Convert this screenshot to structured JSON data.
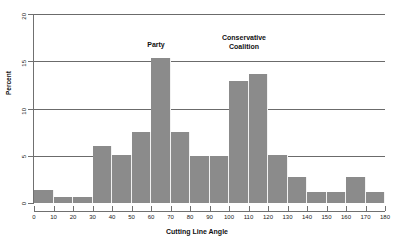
{
  "chart_data": {
    "type": "bar",
    "title": "",
    "subtitle": "",
    "xlabel": "Cutting Line Angle",
    "ylabel": "Percent",
    "xlim": [
      0,
      180
    ],
    "ylim": [
      0,
      20
    ],
    "grid": true,
    "legend_position": "none",
    "bar_color": "#8b8b8b",
    "gridline_color": "#6b6b6b",
    "axis_color": "#707070",
    "xtick_labels": [
      "0",
      "10",
      "20",
      "30",
      "40",
      "50",
      "60",
      "70",
      "80",
      "90",
      "100",
      "110",
      "120",
      "130",
      "140",
      "150",
      "160",
      "170",
      "180"
    ],
    "xtick_values": [
      0,
      10,
      20,
      30,
      40,
      50,
      60,
      70,
      80,
      90,
      100,
      110,
      120,
      130,
      140,
      150,
      160,
      170,
      180
    ],
    "ytick_labels": [
      "0",
      "5",
      "10",
      "15",
      "20"
    ],
    "ytick_values": [
      0,
      5,
      10,
      15,
      20
    ],
    "bin_width": 10,
    "categories": [
      "0-10",
      "10-20",
      "20-30",
      "30-40",
      "40-50",
      "50-60",
      "60-70",
      "70-80",
      "80-90",
      "90-100",
      "100-110",
      "110-120",
      "120-130",
      "130-140",
      "140-150",
      "150-160",
      "160-170",
      "170-180"
    ],
    "bin_starts": [
      0,
      10,
      20,
      30,
      40,
      50,
      60,
      70,
      80,
      90,
      100,
      110,
      120,
      130,
      140,
      150,
      160,
      170
    ],
    "values": [
      1.4,
      0.6,
      0.6,
      6.0,
      5.1,
      7.5,
      15.3,
      7.5,
      5.0,
      5.0,
      12.9,
      13.7,
      5.1,
      2.8,
      1.2,
      1.2,
      2.8,
      1.2
    ],
    "annotations": [
      {
        "name": "party",
        "text": "Party",
        "bin": "60-70"
      },
      {
        "name": "conservative-coalition",
        "text": "Conservative\nCoalition",
        "bin": "100-120"
      }
    ]
  }
}
